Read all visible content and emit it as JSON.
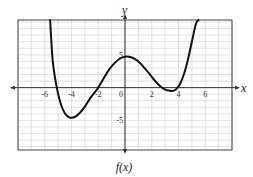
{
  "chart_data": {
    "type": "line",
    "title": "",
    "caption": "f(x)",
    "xlabel": "x",
    "ylabel": "y",
    "xlim": [
      -8,
      8
    ],
    "ylim": [
      -9.5,
      10.3
    ],
    "grid": true,
    "x_ticks": [
      -6,
      -4,
      -2,
      0,
      2,
      4,
      6
    ],
    "x_tick_labels": [
      "-6",
      "-4",
      "-2",
      "0",
      "2",
      "4",
      "6"
    ],
    "y_ticks": [
      5,
      -5
    ],
    "y_tick_labels": [
      "5",
      "-5"
    ],
    "series": [
      {
        "name": "f(x)",
        "x": [
          -5.6,
          -5.4,
          -5.1,
          -4.8,
          -4.5,
          -4.2,
          -4.0,
          -3.7,
          -3.4,
          -3.0,
          -2.6,
          -2.3,
          -2.0,
          -1.6,
          -1.2,
          -0.8,
          -0.4,
          0.0,
          0.3,
          0.7,
          1.1,
          1.5,
          1.9,
          2.3,
          2.7,
          3.0,
          3.3,
          3.55,
          3.8,
          4.1,
          4.4,
          4.7,
          5.0,
          5.3,
          5.5
        ],
        "y": [
          10.3,
          4.0,
          0.0,
          -2.5,
          -3.9,
          -4.5,
          -4.6,
          -4.4,
          -3.9,
          -2.9,
          -1.6,
          -0.8,
          0.0,
          1.4,
          2.7,
          3.7,
          4.4,
          4.7,
          4.7,
          4.4,
          3.8,
          2.9,
          1.9,
          0.9,
          0.1,
          -0.3,
          -0.45,
          -0.5,
          -0.3,
          0.5,
          2.0,
          4.2,
          7.0,
          9.7,
          10.3
        ]
      }
    ],
    "key_points": {
      "zeros": [
        -5.1,
        -2.0,
        3.2,
        3.9
      ],
      "local_min_1": [
        -4.0,
        -4.6
      ],
      "local_max": [
        0.3,
        4.7
      ],
      "local_min_2": [
        3.55,
        -0.5
      ]
    }
  }
}
